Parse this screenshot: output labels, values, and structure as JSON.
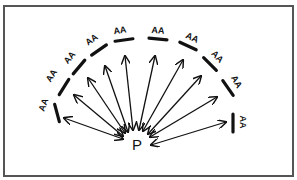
{
  "diagram": {
    "center_label": "P",
    "center": {
      "x": 137,
      "y": 145
    },
    "frame": {
      "x": 4,
      "y": 6,
      "w": 289,
      "h": 170,
      "color": "#555555"
    },
    "ink_color": "#111111",
    "markers": [
      {
        "label": "AA",
        "x": 57,
        "y": 113,
        "angle": 75,
        "lx": 44,
        "ly": 105,
        "la": -70,
        "ax": 64,
        "ay": 118
      },
      {
        "label": "AA",
        "x": 64,
        "y": 87,
        "angle": -58,
        "lx": 52,
        "ly": 76,
        "la": -58,
        "ax": 74,
        "ay": 95
      },
      {
        "label": "AA",
        "x": 79,
        "y": 67,
        "angle": -50,
        "lx": 70,
        "ly": 58,
        "la": -50,
        "ax": 88,
        "ay": 78
      },
      {
        "label": "AA",
        "x": 99,
        "y": 50,
        "angle": -35,
        "lx": 92,
        "ly": 40,
        "la": -35,
        "ax": 105,
        "ay": 66
      },
      {
        "label": "AA",
        "x": 124,
        "y": 40,
        "angle": -8,
        "lx": 120,
        "ly": 31,
        "la": -8,
        "ax": 125,
        "ay": 56
      },
      {
        "label": "AA",
        "x": 158,
        "y": 39,
        "angle": 5,
        "lx": 158,
        "ly": 31,
        "la": 5,
        "ax": 155,
        "ay": 56
      },
      {
        "label": "AA",
        "x": 188,
        "y": 46,
        "angle": 25,
        "lx": 192,
        "ly": 38,
        "la": 25,
        "ax": 183,
        "ay": 60
      },
      {
        "label": "AA",
        "x": 210,
        "y": 64,
        "angle": 45,
        "lx": 217,
        "ly": 57,
        "la": 45,
        "ax": 201,
        "ay": 76
      },
      {
        "label": "AA",
        "x": 228,
        "y": 88,
        "angle": 55,
        "lx": 236,
        "ly": 82,
        "la": 60,
        "ax": 217,
        "ay": 97
      },
      {
        "label": "AA",
        "x": 233,
        "y": 123,
        "angle": 90,
        "lx": 242,
        "ly": 122,
        "la": 90,
        "ax": 226,
        "ay": 122
      }
    ],
    "arrow_ends": [
      {
        "x": 123,
        "y": 139
      },
      {
        "x": 123,
        "y": 136
      },
      {
        "x": 125,
        "y": 133
      },
      {
        "x": 128,
        "y": 132
      },
      {
        "x": 133,
        "y": 130
      },
      {
        "x": 139,
        "y": 130
      },
      {
        "x": 143,
        "y": 131
      },
      {
        "x": 148,
        "y": 134
      },
      {
        "x": 150,
        "y": 137
      },
      {
        "x": 151,
        "y": 145
      }
    ]
  }
}
